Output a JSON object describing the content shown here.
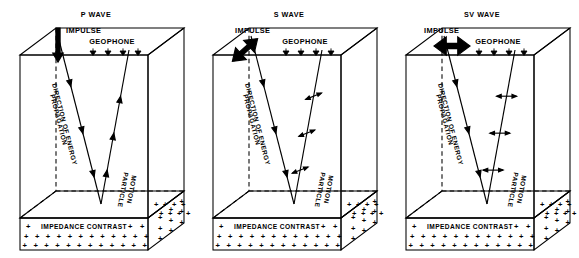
{
  "figure": {
    "panel_count": 3,
    "background_color": "#ffffff",
    "ink_color": "#000000"
  },
  "common": {
    "impulse_label": "IMPULSE",
    "geophone_label": "GEOPHONE",
    "geophone_count": 4,
    "geophone_icon": "downward-triangle-icon",
    "direction_label_line1": "DIRECTION OF ENERGY",
    "direction_label_line2": "PROPAGATION",
    "particle_label_line1": "PARTICLE",
    "particle_label_line2": "MOTION",
    "impedance_label": "IMPEDANCE CONTRAST",
    "impedance_symbol": "+",
    "impedance_rows": 3
  },
  "panels": [
    {
      "id": "p-wave",
      "title": "P WAVE",
      "impulse_arrow": "vertical-down-single-headed",
      "impulse_arrow_heads": 1,
      "particle_motion_arrow": "along-ray-single-headed",
      "particle_motion_orientation": "parallel-to-ray",
      "motion_description": "compressional, particle motion parallel to direction of propagation"
    },
    {
      "id": "s-wave",
      "title": "S WAVE",
      "impulse_arrow": "diagonal-double-headed",
      "impulse_arrow_heads": 2,
      "particle_motion_arrow": "diagonal-double-headed",
      "particle_motion_orientation": "oblique-to-ray",
      "motion_description": "shear, particle motion transverse and oblique to direction of propagation"
    },
    {
      "id": "sv-wave",
      "title": "SV WAVE",
      "impulse_arrow": "horizontal-double-headed",
      "impulse_arrow_heads": 2,
      "particle_motion_arrow": "horizontal-double-headed",
      "particle_motion_orientation": "perpendicular-to-ray",
      "motion_description": "vertically polarized shear, particle motion perpendicular to direction of propagation"
    }
  ]
}
